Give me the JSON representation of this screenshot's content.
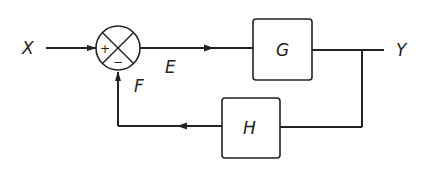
{
  "diagram": {
    "type": "feedback-control-block-diagram",
    "signals": {
      "input": "X",
      "error": "E",
      "feedback": "F",
      "output": "Y"
    },
    "blocks": {
      "forward": "G",
      "feedback": "H"
    },
    "summing_junction": {
      "plus_sign": "+",
      "minus_sign": "−"
    },
    "colors": {
      "line": "#222222",
      "background": "#ffffff"
    }
  }
}
